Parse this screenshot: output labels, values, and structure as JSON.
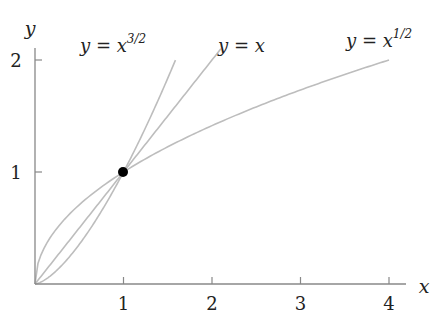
{
  "chart_data": {
    "type": "line",
    "title": "",
    "xlabel": "x",
    "ylabel": "y",
    "xlim": [
      0,
      4.2
    ],
    "ylim": [
      0,
      2.1
    ],
    "x_ticks": [
      "1",
      "2",
      "3",
      "4"
    ],
    "y_ticks": [
      "1",
      "2"
    ],
    "grid": false,
    "legend": "inline labels",
    "series": [
      {
        "name": "y = x^{3/2}",
        "label_base": "y = x",
        "label_sup": "3/2",
        "exponent": 1.5,
        "x_range": [
          0,
          1.587
        ]
      },
      {
        "name": "y = x",
        "label_base": "y = x",
        "label_sup": "",
        "exponent": 1.0,
        "x_range": [
          0,
          2.1
        ]
      },
      {
        "name": "y = x^{1/2}",
        "label_base": "y = x",
        "label_sup": "1/2",
        "exponent": 0.5,
        "x_range": [
          0,
          4
        ]
      }
    ],
    "annotations": [
      {
        "type": "point",
        "x": 1,
        "y": 1,
        "label": "intersection (1,1)"
      }
    ]
  },
  "colors": {
    "curve": "#bdbdbd",
    "axis": "#888888",
    "point": "#000000",
    "text": "#222222"
  }
}
